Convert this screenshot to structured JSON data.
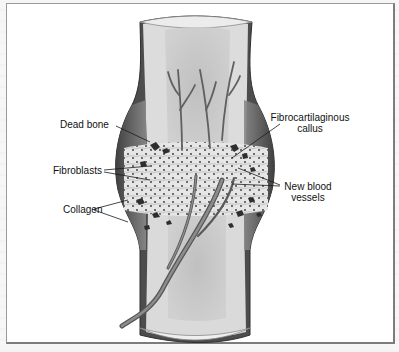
{
  "figure": {
    "labels": {
      "dead_bone": "Dead bone",
      "fibroblasts": "Fibroblasts",
      "collagen": "Collagen",
      "callus_line1": "Fibrocartilaginous",
      "callus_line2": "callus",
      "vessels_line1": "New blood",
      "vessels_line2": "vessels"
    },
    "colors": {
      "bone_outer": "#d8d8d8",
      "bone_marrow": "#b8b8b8",
      "periosteum": "#5a5a5a",
      "vessel": "#6e6e6e",
      "callus": "#e2e2e2",
      "fragments": "#3a3a3a",
      "border": "#7c7c7c"
    }
  }
}
